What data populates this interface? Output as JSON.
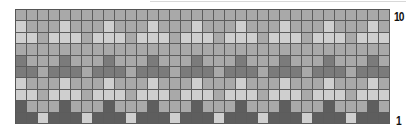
{
  "chart": {
    "columns": 34,
    "rows": 10,
    "row_label_top": "10",
    "row_label_bottom": "1"
  },
  "palette": {
    "L": "#cfcfcf",
    "M": "#a9a9a9",
    "D": "#7b7b7b",
    "V": "#5e5e5e"
  },
  "row_patterns": [
    {
      "row": 10,
      "repeat": [
        "M",
        "M",
        "M",
        "M"
      ]
    },
    {
      "row": 9,
      "repeat": [
        "L",
        "M",
        "M",
        "M"
      ]
    },
    {
      "row": 8,
      "repeat": [
        "L",
        "L",
        "M",
        "L"
      ]
    },
    {
      "row": 7,
      "repeat": [
        "M",
        "M",
        "M",
        "M"
      ]
    },
    {
      "row": 6,
      "repeat": [
        "D",
        "M",
        "M",
        "M"
      ]
    },
    {
      "row": 5,
      "repeat": [
        "D",
        "D",
        "M",
        "D"
      ]
    },
    {
      "row": 4,
      "repeat": [
        "L",
        "M",
        "M",
        "M"
      ]
    },
    {
      "row": 3,
      "repeat": [
        "L",
        "L",
        "M",
        "L"
      ]
    },
    {
      "row": 2,
      "repeat": [
        "V",
        "M",
        "M",
        "M"
      ]
    },
    {
      "row": 1,
      "repeat": [
        "V",
        "V",
        "L",
        "V"
      ]
    }
  ]
}
